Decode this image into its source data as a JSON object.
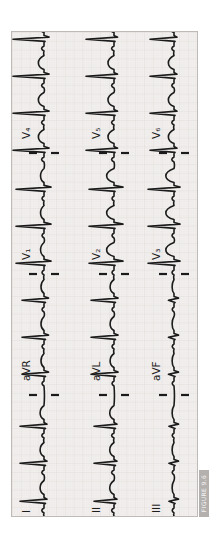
{
  "figure": {
    "tag_label": "FIGURE 9.6"
  },
  "palette": {
    "paper": "#f3f1ef",
    "grid_minor": "#e4e2e0",
    "grid_major": "#d7d4d1",
    "trace": "#1b1b1b",
    "label_text": "#1d1d1d",
    "panel_border": "#bdbab7",
    "tag_bg": "#b3b0ae",
    "tag_text": "#f7f6f5",
    "page_bg": "#ffffff"
  },
  "chart_data": {
    "type": "line",
    "orientation": "rotated 90deg counterclockwise; QRS spikes point left, lead labels read bottom-to-top",
    "lead_grid": [
      [
        "I",
        "aVR",
        "V₁",
        "V₄"
      ],
      [
        "II",
        "aVL",
        "V₂",
        "V₅"
      ],
      [
        "III",
        "aVF",
        "V₃",
        "V₆"
      ]
    ],
    "canvas": {
      "w": 185,
      "h": 484
    },
    "baselines_y": [
      32,
      102,
      162
    ],
    "segment_bounds_x": [
      121,
      242,
      363
    ],
    "beats_x": [
      16,
      54,
      91,
      143,
      180,
      217,
      254,
      291,
      328,
      367,
      404,
      441,
      478
    ],
    "rr_interval_px": 37,
    "label_font_px": 10.5,
    "roman_label_x": 3,
    "lead_label_indent": 14,
    "label_rise_px": 14,
    "marker": {
      "half_gap": 7,
      "half_len": 15,
      "stroke_w": 2.2
    },
    "trace_stroke_w": 1.6,
    "rows": [
      {
        "leads": [
          {
            "label": "I",
            "r": 24,
            "s": 3,
            "q": 1.5,
            "p": 2.2,
            "t": 4.5
          },
          {
            "label": "aVR",
            "r": 22,
            "s": 4.5,
            "q": 1.5,
            "p": 2.0,
            "t": 3.5
          },
          {
            "label": "V₁",
            "r": 28,
            "s": 7,
            "q": 1.0,
            "p": 2.0,
            "t": 4.0
          },
          {
            "label": "V₄",
            "r": 31,
            "s": 5,
            "q": 1.0,
            "p": 2.4,
            "t": 6.5
          }
        ]
      },
      {
        "leads": [
          {
            "label": "II",
            "r": 20,
            "s": 3,
            "q": 1.5,
            "p": 2.4,
            "t": 5.0
          },
          {
            "label": "aVL",
            "r": 23,
            "s": 4,
            "q": 1.5,
            "p": 2.0,
            "t": 4.5
          },
          {
            "label": "V₂",
            "r": 25,
            "s": 9,
            "q": 1.0,
            "p": 2.0,
            "t": 8.5
          },
          {
            "label": "V₅",
            "r": 28,
            "s": 3.5,
            "q": 1.0,
            "p": 2.4,
            "t": 7.0
          }
        ]
      },
      {
        "leads": [
          {
            "label": "III",
            "r": 5,
            "s": 4.5,
            "q": 1.0,
            "p": 1.8,
            "t": 2.2
          },
          {
            "label": "aVF",
            "r": 5.5,
            "s": 4.5,
            "q": 1.0,
            "p": 1.8,
            "t": 2.2
          },
          {
            "label": "V₃",
            "r": 26,
            "s": 6,
            "q": 1.0,
            "p": 2.0,
            "t": 9.5
          },
          {
            "label": "V₆",
            "r": 24,
            "s": 3,
            "q": 1.0,
            "p": 2.2,
            "t": 6.5
          }
        ]
      }
    ]
  }
}
